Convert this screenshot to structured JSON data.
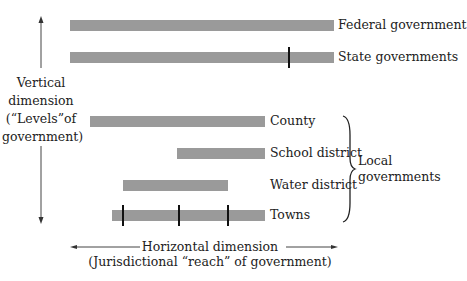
{
  "diagram": {
    "type": "range-bar-diagram",
    "vertical_axis": {
      "lines": [
        "Vertical",
        "dimension",
        "(“Levels”of",
        "government)"
      ]
    },
    "horizontal_axis": {
      "line1": "Horizontal dimension",
      "line2": "(Jurisdictional “reach” of government)"
    },
    "bars": [
      {
        "label": "Federal government",
        "ticks": 0
      },
      {
        "label": "State governments",
        "ticks": 1
      },
      {
        "label": "County",
        "ticks": 0
      },
      {
        "label": "School district",
        "ticks": 0
      },
      {
        "label": "Water district",
        "ticks": 0
      },
      {
        "label": "Towns",
        "ticks": 3
      }
    ],
    "group": {
      "line1": "Local",
      "line2": "governments",
      "members": [
        "County",
        "School district",
        "Water district",
        "Towns"
      ]
    },
    "bar_color": "#9a9a9a"
  }
}
